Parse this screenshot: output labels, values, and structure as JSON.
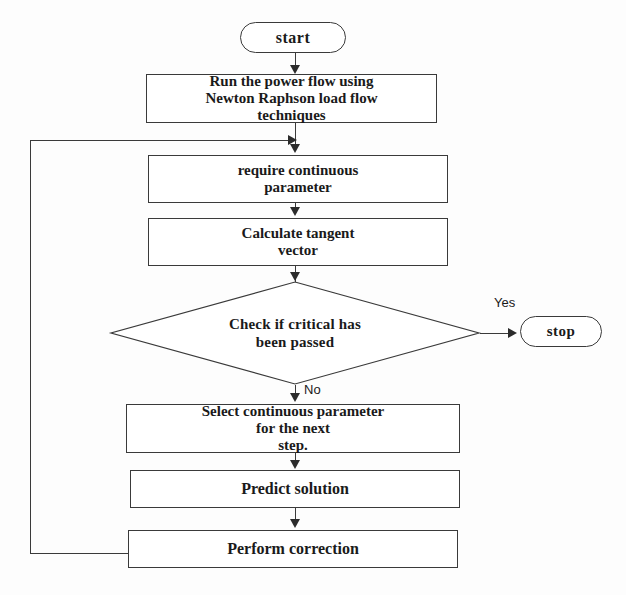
{
  "diagram": {
    "type": "flowchart",
    "colors": {
      "stroke": "#3a3a3a",
      "text": "#1a1a1a",
      "background": "#fdfdfd",
      "arrow": "#2b2b2b"
    },
    "nodes": {
      "start": {
        "label": "start",
        "shape": "terminator"
      },
      "power_flow": {
        "label": "Run the power flow using Newton Raphson load flow techniques",
        "shape": "process"
      },
      "require_param": {
        "label": "require continuous parameter",
        "shape": "process"
      },
      "tangent_vector": {
        "label": "Calculate tangent vector",
        "shape": "process"
      },
      "check_critical": {
        "label": "Check if critical has been passed",
        "shape": "decision"
      },
      "stop": {
        "label": "stop",
        "shape": "terminator"
      },
      "select_param": {
        "label": "Select continuous parameter for the next step.",
        "shape": "process"
      },
      "predict": {
        "label": "Predict solution",
        "shape": "process"
      },
      "correct": {
        "label": "Perform correction",
        "shape": "process"
      }
    },
    "node_text_lines": {
      "power_flow": [
        "Run the power flow using",
        "Newton Raphson load flow",
        "techniques"
      ],
      "require_param": [
        "require continuous",
        "parameter"
      ],
      "tangent_vector": [
        "Calculate tangent",
        "vector"
      ],
      "check_critical": [
        "Check if critical has",
        "been passed"
      ],
      "select_param": [
        "Select continuous parameter",
        "for the next",
        "step."
      ]
    },
    "edge_labels": {
      "yes": "Yes",
      "no": "No"
    },
    "caption": ""
  }
}
